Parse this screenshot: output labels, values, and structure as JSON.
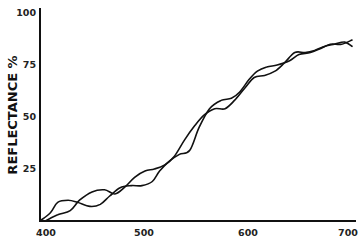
{
  "chart_data": {
    "type": "line",
    "title": "",
    "xlabel": "",
    "ylabel": "REFLECTANCE %",
    "xlim": [
      400,
      700
    ],
    "ylim": [
      0,
      100
    ],
    "xticks": [
      400,
      500,
      600,
      700
    ],
    "yticks": [
      25,
      50,
      75,
      100
    ],
    "xtick_labels": [
      "400",
      "500",
      "600",
      "700"
    ],
    "ytick_labels": [
      "25",
      "50",
      "75",
      "100"
    ],
    "grid": false,
    "legend": "none",
    "series": [
      {
        "name": "curve-a",
        "x": [
          400,
          410,
          417,
          427,
          436,
          448,
          458,
          467,
          477,
          488,
          498,
          508,
          515,
          525,
          534,
          544,
          553,
          563,
          574,
          584,
          592,
          601,
          609,
          618,
          628,
          640,
          649,
          660,
          670,
          679,
          690,
          700
        ],
        "y": [
          0,
          4,
          9,
          10,
          9,
          7,
          8,
          12,
          16,
          17,
          17,
          19,
          24,
          29,
          32,
          34,
          45,
          54,
          58,
          59,
          62,
          68,
          72,
          74,
          75,
          77,
          80,
          81,
          83,
          85,
          85,
          87
        ]
      },
      {
        "name": "curve-b",
        "x": [
          405,
          417,
          429,
          438,
          450,
          462,
          472,
          481,
          491,
          501,
          510,
          520,
          529,
          539,
          549,
          558,
          568,
          578,
          587,
          597,
          606,
          616,
          626,
          635,
          645,
          655,
          664,
          674,
          683,
          693,
          700
        ],
        "y": [
          0,
          3,
          5,
          10,
          14,
          15,
          13,
          16,
          21,
          24,
          25,
          27,
          31,
          39,
          46,
          51,
          54,
          54,
          58,
          64,
          69,
          70,
          72,
          76,
          81,
          81,
          82,
          84,
          85,
          86,
          84
        ]
      }
    ]
  }
}
